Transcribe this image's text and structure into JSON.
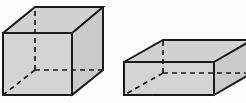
{
  "figure": {
    "background_color": "#fdfdfd",
    "width": 246,
    "height": 103,
    "stroke_color": "#1a1a1a",
    "hidden_stroke_color": "#1a1a1a",
    "face_fill_top": "#d2d2d2",
    "face_fill_front": "#d4d4d4",
    "face_fill_side": "#cacaca",
    "stroke_width": 2,
    "hidden_stroke_width": 1.7,
    "hidden_dash_pattern": "5,4"
  },
  "shapes": [
    {
      "id": "cube",
      "name": "cube",
      "label": "",
      "description": "Cube drawn in oblique projection with hidden edges dashed",
      "vertices": {
        "front_top_left": [
          3,
          33
        ],
        "front_top_right": [
          72,
          33
        ],
        "front_bottom_left": [
          3,
          95
        ],
        "front_bottom_right": [
          72,
          95
        ],
        "back_top_left": [
          35,
          7
        ],
        "back_top_right": [
          103,
          7
        ],
        "back_bottom_left": [
          35,
          70
        ],
        "back_bottom_right": [
          103,
          70
        ]
      },
      "visible_edges": [
        [
          "front_top_left",
          "front_top_right"
        ],
        [
          "front_top_right",
          "front_bottom_right"
        ],
        [
          "front_bottom_right",
          "front_bottom_left"
        ],
        [
          "front_bottom_left",
          "front_top_left"
        ],
        [
          "front_top_left",
          "back_top_left"
        ],
        [
          "front_top_right",
          "back_top_right"
        ],
        [
          "back_top_left",
          "back_top_right"
        ],
        [
          "back_top_right",
          "back_bottom_right"
        ],
        [
          "front_bottom_right",
          "back_bottom_right"
        ]
      ],
      "hidden_edges": [
        [
          "back_bottom_left",
          "back_top_left"
        ],
        [
          "back_bottom_left",
          "back_bottom_right"
        ],
        [
          "back_bottom_left",
          "front_bottom_left"
        ]
      ]
    },
    {
      "id": "rectangular-prism",
      "name": "rectangular prism",
      "label": "",
      "description": "Flat rectangular box (cuboid) drawn in oblique projection, cropped at right edge",
      "vertices": {
        "front_top_left": [
          124,
          62
        ],
        "front_top_right": [
          214,
          62
        ],
        "front_bottom_left": [
          124,
          95
        ],
        "front_bottom_right": [
          214,
          95
        ],
        "back_top_left": [
          163,
          40
        ],
        "back_top_right": [
          252,
          40
        ],
        "back_bottom_left": [
          163,
          73
        ],
        "back_bottom_right": [
          252,
          73
        ]
      },
      "visible_edges": [
        [
          "front_top_left",
          "front_top_right"
        ],
        [
          "front_top_right",
          "front_bottom_right"
        ],
        [
          "front_bottom_right",
          "front_bottom_left"
        ],
        [
          "front_bottom_left",
          "front_top_left"
        ],
        [
          "front_top_left",
          "back_top_left"
        ],
        [
          "front_top_right",
          "back_top_right"
        ],
        [
          "back_top_left",
          "back_top_right"
        ],
        [
          "back_top_right",
          "back_bottom_right"
        ],
        [
          "front_bottom_right",
          "back_bottom_right"
        ]
      ],
      "hidden_edges": [
        [
          "back_bottom_left",
          "back_top_left"
        ],
        [
          "back_bottom_left",
          "back_bottom_right"
        ],
        [
          "back_bottom_left",
          "front_bottom_left"
        ]
      ]
    }
  ]
}
